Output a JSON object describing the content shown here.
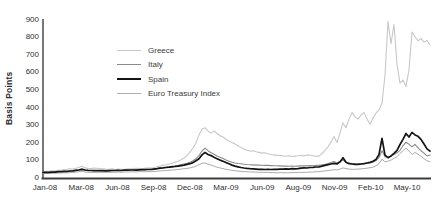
{
  "chart_data": {
    "type": "line",
    "title": "",
    "ylabel": "Basis Points",
    "xlabel": "",
    "ylim": [
      0,
      900
    ],
    "y_ticks": [
      0,
      100,
      200,
      300,
      400,
      500,
      600,
      700,
      800,
      900
    ],
    "x_tick_labels": [
      "Jan-08",
      "Mar-08",
      "Jun-08",
      "Sep-08",
      "Dec-08",
      "Mar-09",
      "Jun-09",
      "Aug-09",
      "Nov-09",
      "Feb-10",
      "May-10"
    ],
    "grid": false,
    "legend_position": "upper-left-inside",
    "axis_color": "#3d3d3d",
    "series": [
      {
        "name": "Greece",
        "color": "#c8c8c8",
        "width": 1.1,
        "values": [
          30,
          32,
          33,
          35,
          36,
          39,
          38,
          42,
          44,
          47,
          45,
          50,
          55,
          61,
          52,
          49,
          48,
          51,
          50,
          48,
          47,
          45,
          44,
          46,
          43,
          45,
          44,
          42,
          46,
          47,
          48,
          50,
          49,
          47,
          50,
          52,
          51,
          54,
          58,
          62,
          66,
          70,
          74,
          78,
          84,
          90,
          98,
          108,
          122,
          142,
          165,
          195,
          240,
          272,
          281,
          262,
          250,
          262,
          248,
          235,
          228,
          215,
          205,
          196,
          188,
          178,
          168,
          160,
          152,
          148,
          150,
          144,
          140,
          136,
          138,
          132,
          128,
          126,
          122,
          124,
          120,
          118,
          121,
          117,
          119,
          121,
          124,
          120,
          126,
          124,
          122,
          116,
          120,
          134,
          152,
          172,
          200,
          230,
          196,
          252,
          308,
          280,
          328,
          368,
          344,
          330,
          352,
          368,
          330,
          300,
          336,
          364,
          382,
          420,
          580,
          885,
          760,
          868,
          640,
          535,
          552,
          516,
          610,
          826,
          800,
          776,
          790,
          768,
          778,
          752
        ]
      },
      {
        "name": "Italy",
        "color": "#8a8a8a",
        "width": 1.1,
        "values": [
          24,
          25,
          26,
          27,
          27,
          29,
          30,
          32,
          31,
          34,
          36,
          40,
          42,
          46,
          40,
          38,
          37,
          36,
          37,
          35,
          35,
          34,
          35,
          36,
          37,
          38,
          37,
          39,
          39,
          40,
          41,
          40,
          42,
          43,
          42,
          44,
          44,
          46,
          48,
          51,
          53,
          56,
          58,
          61,
          63,
          66,
          70,
          74,
          78,
          84,
          92,
          104,
          122,
          148,
          164,
          150,
          138,
          130,
          120,
          112,
          105,
          96,
          90,
          84,
          80,
          77,
          75,
          73,
          71,
          70,
          69,
          68,
          68,
          67,
          66,
          66,
          65,
          64,
          64,
          63,
          62,
          62,
          61,
          62,
          61,
          62,
          63,
          64,
          63,
          65,
          64,
          66,
          68,
          70,
          73,
          77,
          82,
          88,
          80,
          90,
          96,
          84,
          80,
          77,
          75,
          74,
          75,
          76,
          78,
          80,
          85,
          94,
          110,
          150,
          115,
          112,
          118,
          128,
          138,
          152,
          178,
          198,
          186,
          172,
          186,
          166,
          150,
          136,
          120,
          126
        ]
      },
      {
        "name": "Spain",
        "color": "#141414",
        "width": 1.7,
        "values": [
          26,
          27,
          27,
          28,
          28,
          30,
          31,
          32,
          32,
          34,
          35,
          38,
          40,
          44,
          40,
          38,
          37,
          36,
          37,
          36,
          36,
          35,
          36,
          37,
          37,
          38,
          37,
          39,
          39,
          40,
          40,
          39,
          41,
          42,
          42,
          43,
          43,
          45,
          47,
          50,
          52,
          54,
          56,
          58,
          60,
          62,
          65,
          68,
          72,
          76,
          82,
          92,
          104,
          126,
          140,
          128,
          122,
          112,
          104,
          96,
          90,
          82,
          75,
          68,
          62,
          58,
          54,
          51,
          49,
          47,
          46,
          45,
          44,
          44,
          43,
          44,
          43,
          44,
          44,
          45,
          45,
          46,
          45,
          47,
          46,
          48,
          50,
          52,
          51,
          54,
          55,
          57,
          58,
          62,
          66,
          70,
          74,
          78,
          74,
          86,
          110,
          84,
          76,
          74,
          72,
          72,
          74,
          76,
          80,
          84,
          90,
          100,
          128,
          220,
          124,
          110,
          120,
          135,
          152,
          185,
          215,
          248,
          228,
          254,
          240,
          232,
          214,
          188,
          160,
          147
        ]
      },
      {
        "name": "Euro Treasury Index",
        "color": "#aeaeae",
        "width": 1.0,
        "values": [
          19,
          20,
          20,
          21,
          21,
          22,
          23,
          24,
          23,
          25,
          26,
          28,
          30,
          33,
          29,
          27,
          26,
          26,
          27,
          26,
          27,
          26,
          27,
          27,
          27,
          28,
          27,
          28,
          29,
          29,
          29,
          29,
          30,
          30,
          30,
          31,
          31,
          32,
          33,
          35,
          36,
          37,
          39,
          40,
          41,
          43,
          45,
          47,
          49,
          52,
          56,
          62,
          70,
          78,
          80,
          74,
          68,
          62,
          56,
          52,
          48,
          44,
          41,
          38,
          36,
          34,
          32,
          31,
          30,
          29,
          28,
          28,
          27,
          27,
          26,
          26,
          25,
          25,
          24,
          25,
          24,
          24,
          24,
          25,
          25,
          26,
          26,
          27,
          27,
          28,
          28,
          30,
          31,
          33,
          35,
          37,
          39,
          42,
          40,
          45,
          52,
          48,
          45,
          44,
          44,
          45,
          46,
          48,
          50,
          53,
          56,
          64,
          76,
          102,
          86,
          90,
          96,
          106,
          116,
          134,
          150,
          164,
          148,
          128,
          140,
          130,
          118,
          104,
          92,
          88
        ]
      }
    ]
  }
}
